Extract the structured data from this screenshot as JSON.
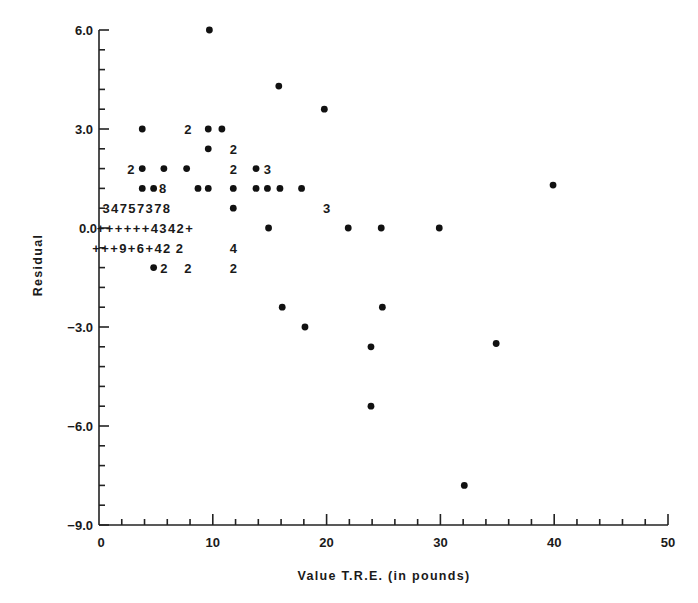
{
  "chart_data": {
    "type": "scatter",
    "title": "",
    "xlabel": "Value T.R.E. (in pounds)",
    "ylabel": "Residual",
    "xlim": [
      0,
      50
    ],
    "ylim": [
      -9.0,
      6.0
    ],
    "x_ticks": [
      "0",
      "10",
      "20",
      "30",
      "40",
      "50"
    ],
    "y_ticks": [
      "6.0",
      "3.0",
      "0.0",
      "-3.0",
      "-6.0",
      "-9.0"
    ],
    "x_minor_step": 2,
    "y_minor_step": 0.6,
    "grid": false,
    "legend": null,
    "note": "Character plot: '•' = single observation, digits = count of overlapping observations, '+' = near-zero observation markers",
    "points": [
      {
        "x": 9.7,
        "y": 6.0,
        "mark": "•"
      },
      {
        "x": 15.8,
        "y": 4.3,
        "mark": "•"
      },
      {
        "x": 19.8,
        "y": 3.6,
        "mark": "•"
      },
      {
        "x": 3.8,
        "y": 3.0,
        "mark": "•"
      },
      {
        "x": 7.8,
        "y": 3.0,
        "mark": "2"
      },
      {
        "x": 9.6,
        "y": 3.0,
        "mark": "•"
      },
      {
        "x": 10.8,
        "y": 3.0,
        "mark": "•"
      },
      {
        "x": 9.6,
        "y": 2.4,
        "mark": "•"
      },
      {
        "x": 11.8,
        "y": 2.4,
        "mark": "2"
      },
      {
        "x": 2.8,
        "y": 1.8,
        "mark": "2"
      },
      {
        "x": 3.8,
        "y": 1.8,
        "mark": "•"
      },
      {
        "x": 5.7,
        "y": 1.8,
        "mark": "•"
      },
      {
        "x": 7.7,
        "y": 1.8,
        "mark": "•"
      },
      {
        "x": 11.8,
        "y": 1.8,
        "mark": "2"
      },
      {
        "x": 13.8,
        "y": 1.8,
        "mark": "•"
      },
      {
        "x": 14.8,
        "y": 1.8,
        "mark": "3"
      },
      {
        "x": 3.8,
        "y": 1.2,
        "mark": "•"
      },
      {
        "x": 4.8,
        "y": 1.2,
        "mark": "•"
      },
      {
        "x": 5.6,
        "y": 1.2,
        "mark": "8"
      },
      {
        "x": 8.7,
        "y": 1.2,
        "mark": "•"
      },
      {
        "x": 9.6,
        "y": 1.2,
        "mark": "•"
      },
      {
        "x": 11.8,
        "y": 1.2,
        "mark": "•"
      },
      {
        "x": 13.8,
        "y": 1.2,
        "mark": "•"
      },
      {
        "x": 14.8,
        "y": 1.2,
        "mark": "•"
      },
      {
        "x": 15.9,
        "y": 1.2,
        "mark": "•"
      },
      {
        "x": 17.8,
        "y": 1.2,
        "mark": "•"
      },
      {
        "x": 39.9,
        "y": 1.3,
        "mark": "•"
      },
      {
        "x": 11.8,
        "y": 0.6,
        "mark": "•"
      },
      {
        "x": 20.0,
        "y": 0.6,
        "mark": "3"
      },
      {
        "x": 14.9,
        "y": 0.0,
        "mark": "•"
      },
      {
        "x": 21.9,
        "y": 0.0,
        "mark": "•"
      },
      {
        "x": 24.8,
        "y": 0.0,
        "mark": "•"
      },
      {
        "x": 29.9,
        "y": 0.0,
        "mark": "•"
      },
      {
        "x": 11.8,
        "y": -0.6,
        "mark": "4"
      },
      {
        "x": 4.8,
        "y": -1.2,
        "mark": "•"
      },
      {
        "x": 5.7,
        "y": -1.2,
        "mark": "2"
      },
      {
        "x": 7.8,
        "y": -1.2,
        "mark": "2"
      },
      {
        "x": 11.8,
        "y": -1.2,
        "mark": "2"
      },
      {
        "x": 16.1,
        "y": -2.4,
        "mark": "•"
      },
      {
        "x": 24.9,
        "y": -2.4,
        "mark": "•"
      },
      {
        "x": 18.1,
        "y": -3.0,
        "mark": "•"
      },
      {
        "x": 23.9,
        "y": -3.6,
        "mark": "•"
      },
      {
        "x": 34.9,
        "y": -3.5,
        "mark": "•"
      },
      {
        "x": 23.9,
        "y": -5.4,
        "mark": "•"
      },
      {
        "x": 32.1,
        "y": -7.8,
        "mark": "•"
      }
    ],
    "text_rows": [
      {
        "y": 0.6,
        "x_start": 0.3,
        "text": "3 4 7 5 7 3 7 8"
      },
      {
        "y": 0.0,
        "x_start": -0.2,
        "text": "+ + + + + + 4 3 4 2 +"
      },
      {
        "y": -0.6,
        "x_start": -0.6,
        "text": "+ + + 9 + 6 + 4 2   2"
      }
    ]
  },
  "axes": {
    "x_title": "Value T.R.E. (in pounds)",
    "y_title": "Residual",
    "zero_label": "0.0"
  }
}
